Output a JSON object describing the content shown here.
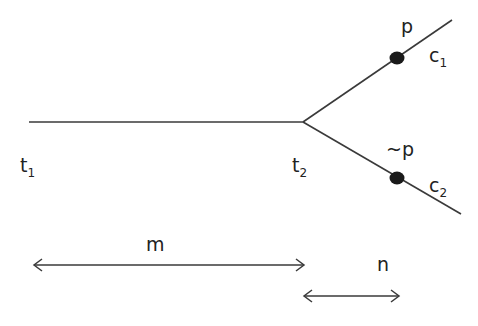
{
  "diagram": {
    "nodes": {
      "start": {
        "label": "t",
        "subscript": "1"
      },
      "branch_point": {
        "label": "t",
        "subscript": "2"
      }
    },
    "branches": [
      {
        "name": "upper",
        "event_label": "p",
        "branch_label": "c",
        "branch_subscript": "1"
      },
      {
        "name": "lower",
        "event_label": "~p",
        "branch_label": "c",
        "branch_subscript": "2"
      }
    ],
    "intervals": [
      {
        "name": "m",
        "label": "m",
        "from": "t1",
        "to": "t2"
      },
      {
        "name": "n",
        "label": "n",
        "from": "t2",
        "to": "event"
      }
    ],
    "colors": {
      "line": "#3a3a3a",
      "dot": "#1a1a1a",
      "text": "#222222",
      "background": "#ffffff"
    }
  }
}
